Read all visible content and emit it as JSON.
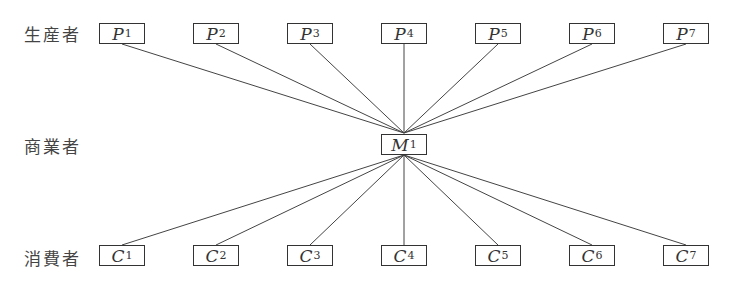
{
  "rows": {
    "producers": {
      "label": "生産者",
      "nodes": [
        {
          "letter": "P",
          "sub": "1"
        },
        {
          "letter": "P",
          "sub": "2"
        },
        {
          "letter": "P",
          "sub": "3"
        },
        {
          "letter": "P",
          "sub": "4"
        },
        {
          "letter": "P",
          "sub": "5"
        },
        {
          "letter": "P",
          "sub": "6"
        },
        {
          "letter": "P",
          "sub": "7"
        }
      ]
    },
    "merchant": {
      "label": "商業者",
      "node": {
        "letter": "M",
        "sub": "1"
      }
    },
    "consumers": {
      "label": "消費者",
      "nodes": [
        {
          "letter": "C",
          "sub": "1"
        },
        {
          "letter": "C",
          "sub": "2"
        },
        {
          "letter": "C",
          "sub": "3"
        },
        {
          "letter": "C",
          "sub": "4"
        },
        {
          "letter": "C",
          "sub": "5"
        },
        {
          "letter": "C",
          "sub": "6"
        },
        {
          "letter": "C",
          "sub": "7"
        }
      ]
    }
  }
}
